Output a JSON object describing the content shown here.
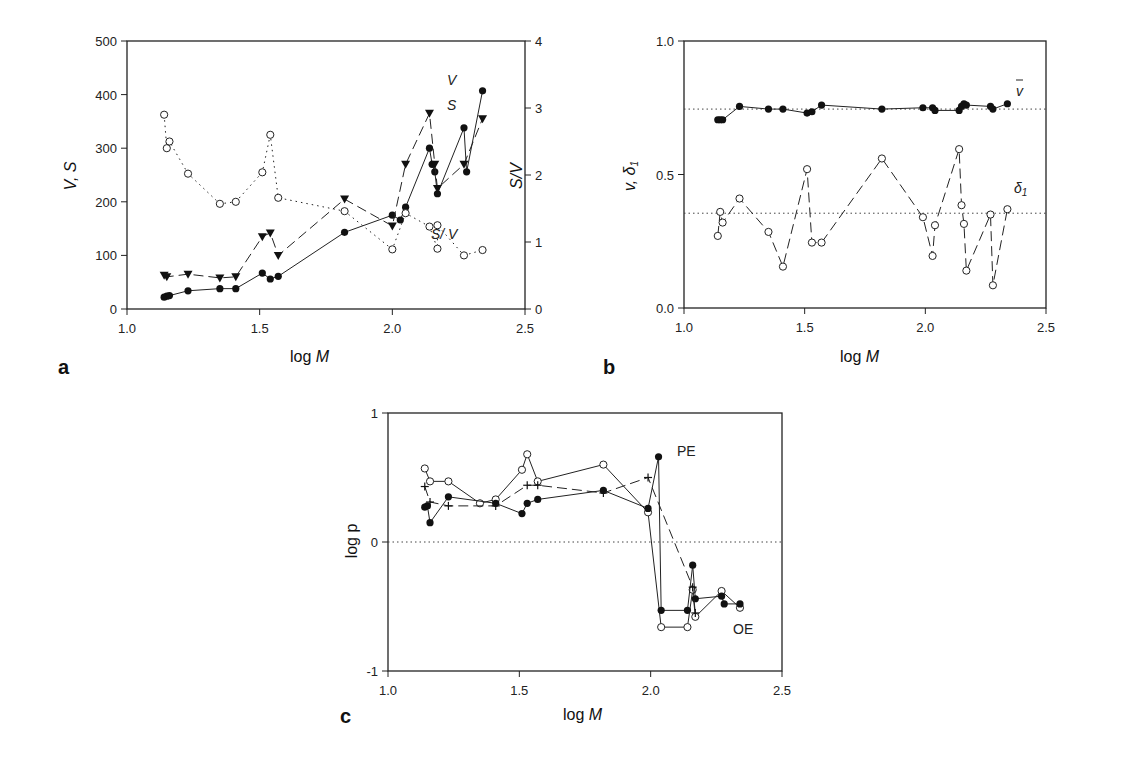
{
  "chart_data": [
    {
      "panel": "a",
      "type": "line",
      "xlabel": "log M",
      "ylabel": "V, S",
      "ylabel_right": "S/V",
      "xlim": [
        1.0,
        2.5
      ],
      "ylim": [
        0,
        500
      ],
      "ylim_right": [
        0,
        4
      ],
      "xticks": [
        "1.0",
        "1.5",
        "2.0",
        "2.5"
      ],
      "yticks": [
        "0",
        "100",
        "200",
        "300",
        "400",
        "500"
      ],
      "yticks_right": [
        "0",
        "1",
        "2",
        "3",
        "4"
      ],
      "series": [
        {
          "name": "V",
          "marker": "filled-circle",
          "line": "solid",
          "axis": "left",
          "x": [
            1.14,
            1.15,
            1.16,
            1.23,
            1.35,
            1.41,
            1.51,
            1.54,
            1.57,
            1.82,
            2.0,
            2.03,
            2.05,
            2.14,
            2.15,
            2.16,
            2.17,
            2.27,
            2.28,
            2.34
          ],
          "y": [
            22,
            24,
            25,
            34,
            38,
            38,
            67,
            56,
            61,
            143,
            175,
            166,
            190,
            300,
            270,
            256,
            215,
            338,
            256,
            407
          ]
        },
        {
          "name": "S",
          "marker": "filled-triangle-down",
          "line": "dashed",
          "axis": "left",
          "x": [
            1.14,
            1.15,
            1.23,
            1.35,
            1.41,
            1.51,
            1.54,
            1.57,
            1.82,
            2.0,
            2.05,
            2.14,
            2.16,
            2.17,
            2.27,
            2.34
          ],
          "y": [
            63,
            60,
            65,
            58,
            60,
            135,
            142,
            100,
            205,
            155,
            270,
            365,
            270,
            225,
            270,
            355
          ]
        },
        {
          "name": "S/V",
          "marker": "open-circle",
          "line": "dotted",
          "axis": "right",
          "x": [
            1.14,
            1.15,
            1.16,
            1.23,
            1.35,
            1.41,
            1.51,
            1.54,
            1.57,
            1.82,
            2.0,
            2.05,
            2.14,
            2.17,
            2.17,
            2.27,
            2.34
          ],
          "y": [
            2.9,
            2.4,
            2.5,
            2.02,
            1.57,
            1.6,
            2.04,
            2.6,
            1.66,
            1.46,
            0.89,
            1.43,
            1.23,
            0.9,
            1.25,
            0.8,
            0.88
          ]
        }
      ],
      "annotations": [
        "V",
        "S",
        "S/V"
      ]
    },
    {
      "panel": "b",
      "type": "line",
      "xlabel": "log M",
      "ylabel": "v̄, δ1",
      "xlim": [
        1.0,
        2.5
      ],
      "ylim": [
        0.0,
        1.0
      ],
      "xticks": [
        "1.0",
        "1.5",
        "2.0",
        "2.5"
      ],
      "yticks": [
        "0.0",
        "0.5",
        "1.0"
      ],
      "reference_lines": [
        0.745,
        0.355
      ],
      "series": [
        {
          "name": "v̄",
          "marker": "filled-circle",
          "line": "solid",
          "x": [
            1.14,
            1.15,
            1.16,
            1.23,
            1.35,
            1.41,
            1.51,
            1.53,
            1.57,
            1.82,
            1.99,
            2.03,
            2.04,
            2.14,
            2.15,
            2.16,
            2.17,
            2.27,
            2.28,
            2.34
          ],
          "y": [
            0.705,
            0.705,
            0.705,
            0.755,
            0.745,
            0.745,
            0.73,
            0.735,
            0.76,
            0.745,
            0.75,
            0.75,
            0.74,
            0.74,
            0.755,
            0.765,
            0.76,
            0.755,
            0.745,
            0.765
          ]
        },
        {
          "name": "δ1",
          "marker": "open-circle",
          "line": "dashed",
          "x": [
            1.14,
            1.15,
            1.16,
            1.23,
            1.35,
            1.41,
            1.51,
            1.53,
            1.57,
            1.82,
            1.99,
            2.03,
            2.04,
            2.14,
            2.15,
            2.16,
            2.17,
            2.27,
            2.28,
            2.34
          ],
          "y": [
            0.27,
            0.36,
            0.32,
            0.41,
            0.285,
            0.155,
            0.52,
            0.245,
            0.245,
            0.56,
            0.34,
            0.195,
            0.31,
            0.595,
            0.385,
            0.315,
            0.14,
            0.35,
            0.085,
            0.37
          ]
        }
      ],
      "annotations": [
        "v̄",
        "δ1"
      ]
    },
    {
      "panel": "c",
      "type": "line",
      "xlabel": "log M",
      "ylabel": "log p",
      "xlim": [
        1.0,
        2.5
      ],
      "ylim": [
        -1,
        1
      ],
      "xticks": [
        "1.0",
        "1.5",
        "2.0",
        "2.5"
      ],
      "yticks": [
        "-1",
        "0",
        "1"
      ],
      "reference_lines": [
        0
      ],
      "series": [
        {
          "name": "open",
          "marker": "open-circle",
          "line": "solid",
          "x": [
            1.14,
            1.16,
            1.23,
            1.35,
            1.41,
            1.51,
            1.53,
            1.57,
            1.82,
            1.99,
            2.04,
            2.14,
            2.16,
            2.17,
            2.27,
            2.34
          ],
          "y": [
            0.57,
            0.47,
            0.47,
            0.3,
            0.33,
            0.56,
            0.68,
            0.47,
            0.6,
            0.23,
            -0.66,
            -0.66,
            -0.37,
            -0.58,
            -0.38,
            -0.51
          ]
        },
        {
          "name": "filled",
          "marker": "filled-circle",
          "line": "solid",
          "x": [
            1.14,
            1.15,
            1.16,
            1.23,
            1.41,
            1.51,
            1.53,
            1.57,
            1.82,
            1.99,
            2.03,
            2.04,
            2.14,
            2.16,
            2.17,
            2.27,
            2.28,
            2.34
          ],
          "y": [
            0.27,
            0.28,
            0.15,
            0.35,
            0.3,
            0.22,
            0.3,
            0.33,
            0.4,
            0.26,
            0.66,
            -0.53,
            -0.53,
            -0.18,
            -0.44,
            -0.42,
            -0.48,
            -0.48
          ]
        },
        {
          "name": "cross",
          "marker": "plus",
          "line": "dashed",
          "x": [
            1.14,
            1.16,
            1.23,
            1.41,
            1.53,
            1.57,
            1.82,
            1.99,
            2.16,
            2.17
          ],
          "y": [
            0.43,
            0.31,
            0.28,
            0.28,
            0.44,
            0.44,
            0.38,
            0.5,
            -0.35,
            -0.55
          ]
        }
      ],
      "annotations": [
        "PE",
        "OE"
      ]
    }
  ],
  "labels": {
    "panel_a": "a",
    "panel_b": "b",
    "panel_c": "c",
    "xlabel_log": "log ",
    "xlabel_M": "M",
    "ylabel_a": "V, S",
    "ylabel_a_right": "S/V",
    "ylabel_b": "v, δ",
    "ylabel_c": "log p",
    "ann_V": "V",
    "ann_S": "S",
    "ann_SV": "S/ V",
    "ann_vbar": "v",
    "ann_delta": "δ",
    "ann_delta_sub": "1",
    "ann_PE": "PE",
    "ann_OE": "OE"
  }
}
